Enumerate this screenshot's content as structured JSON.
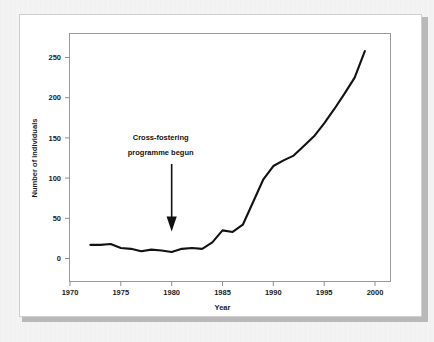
{
  "chart_data": {
    "type": "line",
    "title": "",
    "xlabel": "Year",
    "ylabel": "Number of individuals",
    "xlim": [
      1970,
      2000
    ],
    "ylim": [
      0,
      280
    ],
    "grid": false,
    "legend": null,
    "xticks": [
      "1970",
      "1975",
      "1980",
      "1985",
      "1990",
      "1995",
      "2000"
    ],
    "xtick_values": [
      1970,
      1975,
      1980,
      1985,
      1990,
      1995,
      2000
    ],
    "yticks": [
      "0",
      "50",
      "100",
      "150",
      "200",
      "250"
    ],
    "ytick_values": [
      0,
      50,
      100,
      150,
      200,
      250
    ],
    "series": [
      {
        "name": "Number of individuals",
        "color": "#121212",
        "x": [
          1972,
          1973,
          1974,
          1975,
          1976,
          1977,
          1978,
          1979,
          1980,
          1981,
          1982,
          1983,
          1984,
          1985,
          1986,
          1987,
          1988,
          1989,
          1990,
          1991,
          1992,
          1993,
          1994,
          1995,
          1996,
          1997,
          1998,
          1999
        ],
        "values": [
          17,
          17,
          18,
          13,
          12,
          9,
          11,
          10,
          8,
          12,
          13,
          12,
          20,
          35,
          33,
          42,
          70,
          98,
          115,
          122,
          128,
          140,
          152,
          168,
          186,
          205,
          225,
          258
        ]
      }
    ],
    "annotations": [
      {
        "name": "cross-fostering-annotation",
        "line1": "Cross-fostering",
        "line2": "programme begun",
        "x": 1980,
        "y": 20,
        "arrow": "down"
      }
    ]
  }
}
